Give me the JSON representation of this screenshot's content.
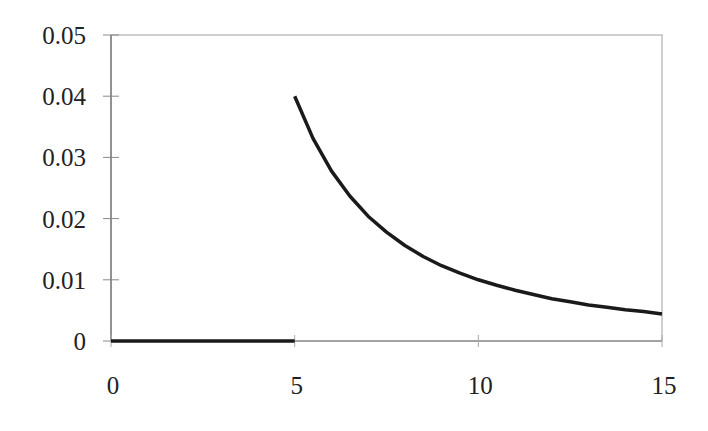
{
  "chart_data": {
    "type": "line",
    "title": "",
    "xlabel": "",
    "ylabel": "",
    "xlim": [
      0,
      15
    ],
    "ylim": [
      0,
      0.05
    ],
    "grid": false,
    "legend": null,
    "x_ticks": [
      "0",
      "5",
      "10",
      "15"
    ],
    "y_ticks": [
      "0",
      "0.01",
      "0.02",
      "0.03",
      "0.04",
      "0.05"
    ],
    "series": [
      {
        "name": "zero segment",
        "x": [
          0,
          5
        ],
        "y": [
          0,
          0
        ]
      },
      {
        "name": "decaying curve (approx. 1/x^2)",
        "x": [
          5,
          5.5,
          6,
          6.5,
          7,
          7.5,
          8,
          8.5,
          9,
          9.5,
          10,
          10.5,
          11,
          11.5,
          12,
          12.5,
          13,
          13.5,
          14,
          14.5,
          15
        ],
        "y": [
          0.04,
          0.0331,
          0.0278,
          0.0237,
          0.0204,
          0.0178,
          0.0156,
          0.0138,
          0.0123,
          0.0111,
          0.01,
          0.0091,
          0.0083,
          0.0076,
          0.0069,
          0.0064,
          0.0059,
          0.0055,
          0.0051,
          0.0048,
          0.0044
        ]
      }
    ],
    "colors": {
      "line": "#1a1a1a",
      "frame": "#999999",
      "axis": "#555555"
    }
  }
}
